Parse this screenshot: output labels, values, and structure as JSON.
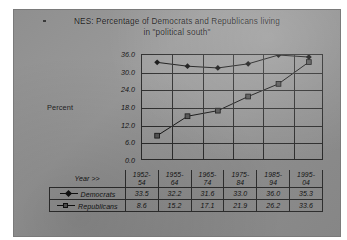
{
  "slide": {
    "title_line1": "NES:  Percentage of Democrats and Republicans living",
    "title_line2": "in \"political south\"",
    "y_axis_label": "Percent",
    "year_header": "Year >>"
  },
  "chart_data": {
    "type": "line",
    "title": "NES:  Percentage of Democrats and Republicans living in \"political south\"",
    "xlabel": "Year >>",
    "ylabel": "Percent",
    "categories": [
      "1952-54",
      "1955-64",
      "1965-74",
      "1975-84",
      "1985-94",
      "1995-04"
    ],
    "category_lines": [
      [
        "1952-",
        "54"
      ],
      [
        "1955-",
        "64"
      ],
      [
        "1965-",
        "74"
      ],
      [
        "1975-",
        "84"
      ],
      [
        "1985-",
        "94"
      ],
      [
        "1995-",
        "04"
      ]
    ],
    "series": [
      {
        "name": "Democrats",
        "marker": "diamond",
        "color": "#111111",
        "values": [
          33.5,
          32.2,
          31.6,
          33.0,
          36.0,
          35.3
        ]
      },
      {
        "name": "Republicans",
        "marker": "square",
        "color": "#555555",
        "values": [
          8.6,
          15.2,
          17.1,
          21.9,
          26.2,
          33.6
        ]
      }
    ],
    "ylim": [
      0.0,
      36.0
    ],
    "ytick_labels": [
      "36.0",
      "30.0",
      "24.0",
      "18.0",
      "12.0",
      "6.0",
      "0.0"
    ],
    "ytick_values": [
      36.0,
      30.0,
      24.0,
      18.0,
      12.0,
      6.0,
      0.0
    ],
    "grid": true,
    "legend_position": "table"
  }
}
